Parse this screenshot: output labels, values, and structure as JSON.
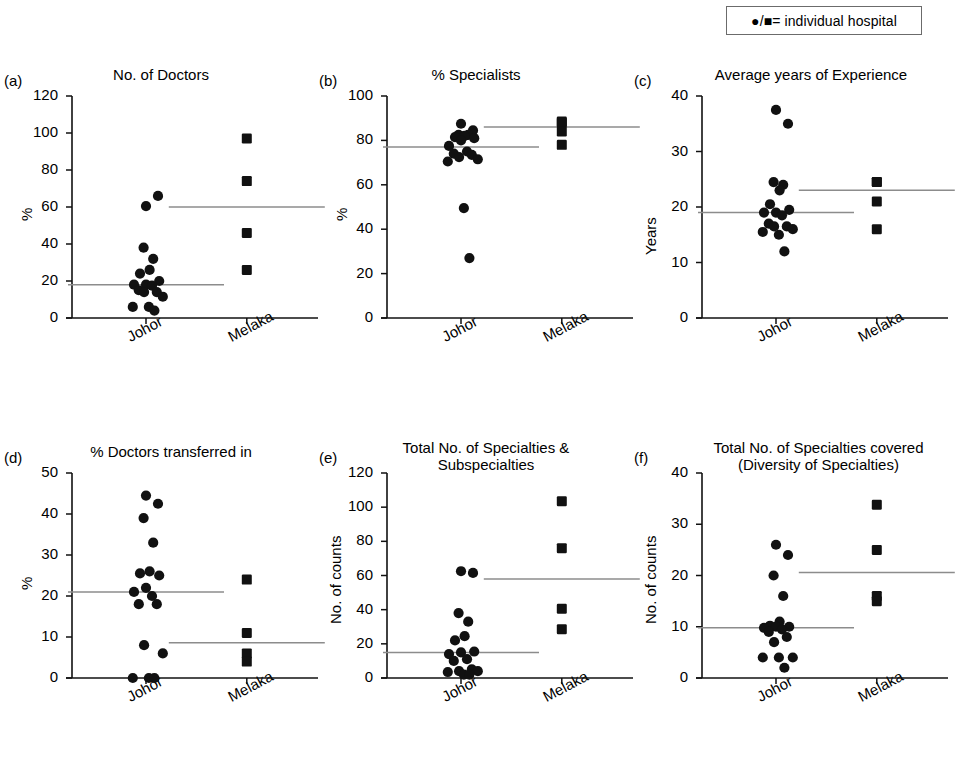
{
  "legend": {
    "text": "●/■= individual hospital",
    "circle_glyph": "●",
    "square_glyph": "■"
  },
  "groups": [
    "Johor",
    "Melaka"
  ],
  "chart_data": [
    {
      "type": "scatter",
      "panel": "(a)",
      "title": "No. of Doctors",
      "xlabel": "",
      "ylabel": "%",
      "ylim": [
        0,
        120
      ],
      "yticks": [
        0,
        20,
        40,
        60,
        80,
        100,
        120
      ],
      "grid": false,
      "legend_position": "top-right-outside",
      "categories": [
        "Johor",
        "Melaka"
      ],
      "series": [
        {
          "name": "Johor",
          "marker": "circle",
          "values": [
            60.5,
            66,
            38,
            32,
            26,
            24,
            20,
            18,
            18,
            17.5,
            15,
            14,
            14,
            11.5,
            6,
            6,
            4
          ],
          "mean": 18
        },
        {
          "name": "Melaka",
          "marker": "square",
          "values": [
            97,
            74,
            46,
            26
          ],
          "mean": 60
        }
      ]
    },
    {
      "type": "scatter",
      "panel": "(b)",
      "title": "% Specialists",
      "xlabel": "",
      "ylabel": "%",
      "ylim": [
        0,
        100
      ],
      "yticks": [
        0,
        20,
        40,
        60,
        80,
        100
      ],
      "grid": false,
      "categories": [
        "Johor",
        "Melaka"
      ],
      "series": [
        {
          "name": "Johor",
          "marker": "circle",
          "values": [
            87.5,
            84.5,
            82.5,
            82.5,
            82,
            81.5,
            81,
            80,
            77.5,
            75,
            74,
            73.5,
            72.5,
            71.5,
            70.5,
            49.5,
            27
          ],
          "mean": 77
        },
        {
          "name": "Melaka",
          "marker": "square",
          "values": [
            88.5,
            88,
            84,
            78
          ],
          "mean": 86
        }
      ]
    },
    {
      "type": "scatter",
      "panel": "(c)",
      "title": "Average years of Experience",
      "xlabel": "",
      "ylabel": "Years",
      "ylim": [
        0,
        40
      ],
      "yticks": [
        0,
        10,
        20,
        30,
        40
      ],
      "grid": false,
      "categories": [
        "Johor",
        "Melaka"
      ],
      "series": [
        {
          "name": "Johor",
          "marker": "circle",
          "values": [
            37.5,
            35,
            24.5,
            24,
            23,
            20.5,
            19.5,
            19,
            19,
            18.5,
            17,
            16.5,
            16.5,
            16,
            15.5,
            15,
            12
          ],
          "mean": 19
        },
        {
          "name": "Melaka",
          "marker": "square",
          "values": [
            24.5,
            24.5,
            21,
            16
          ],
          "mean": 23
        }
      ]
    },
    {
      "type": "scatter",
      "panel": "(d)",
      "title": "% Doctors transferred in",
      "xlabel": "",
      "ylabel": "%",
      "ylim": [
        0,
        50
      ],
      "yticks": [
        0,
        10,
        20,
        30,
        40,
        50
      ],
      "grid": false,
      "categories": [
        "Johor",
        "Melaka"
      ],
      "series": [
        {
          "name": "Johor",
          "marker": "circle",
          "values": [
            44.5,
            42.5,
            39,
            33,
            26,
            25.5,
            25,
            22,
            21,
            20,
            18,
            18,
            8,
            6,
            0,
            0,
            0
          ],
          "mean": 21
        },
        {
          "name": "Melaka",
          "marker": "square",
          "values": [
            24,
            11,
            6,
            4
          ],
          "mean": 8.6
        }
      ]
    },
    {
      "type": "scatter",
      "panel": "(e)",
      "title": "Total No. of Specialties &\nSubspecialties",
      "xlabel": "",
      "ylabel": "No. of counts",
      "ylim": [
        0,
        120
      ],
      "yticks": [
        0,
        20,
        40,
        60,
        80,
        100,
        120
      ],
      "grid": false,
      "categories": [
        "Johor",
        "Melaka"
      ],
      "series": [
        {
          "name": "Johor",
          "marker": "circle",
          "values": [
            62.5,
            61.5,
            38,
            33,
            24.5,
            22,
            15.5,
            15,
            14,
            11,
            10,
            5,
            4,
            4,
            3.5,
            2,
            2
          ],
          "mean": 15
        },
        {
          "name": "Melaka",
          "marker": "square",
          "values": [
            103.5,
            76,
            40.5,
            28.5
          ],
          "mean": 58
        }
      ]
    },
    {
      "type": "scatter",
      "panel": "(f)",
      "title": "Total No. of Specialties covered\n(Diversity of Specialties)",
      "xlabel": "",
      "ylabel": "No. of counts",
      "ylim": [
        0,
        40
      ],
      "yticks": [
        0,
        10,
        20,
        30,
        40
      ],
      "grid": false,
      "categories": [
        "Johor",
        "Melaka"
      ],
      "series": [
        {
          "name": "Johor",
          "marker": "circle",
          "values": [
            26,
            24,
            20,
            16,
            11,
            10.2,
            10,
            10,
            9.8,
            9.5,
            9,
            8,
            7,
            4,
            4,
            4,
            2
          ],
          "mean": 9.8
        },
        {
          "name": "Melaka",
          "marker": "square",
          "values": [
            33.8,
            25,
            16,
            15
          ],
          "mean": 20.6
        }
      ]
    }
  ]
}
